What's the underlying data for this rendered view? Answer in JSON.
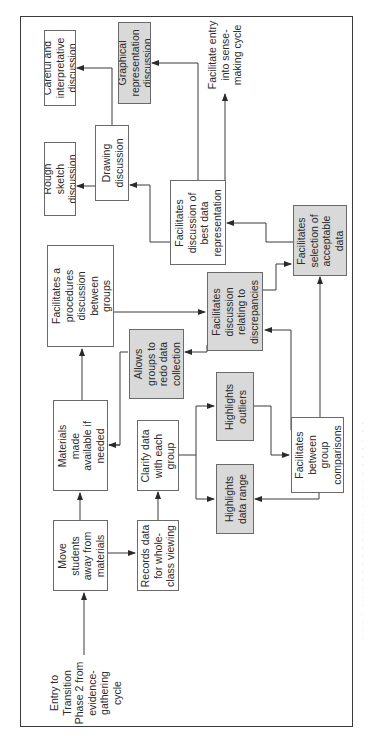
{
  "diagram": {
    "orientation": "rotated 90 degrees counter-clockwise",
    "entry_label": "Entry to\nTransition\nPhase 2 from\nevidence-\ngathering\ncycle",
    "exit_label": "Facilitate entry\ninto sense-\nmaking cycle",
    "nodes": {
      "move_students": {
        "label": "Move\nstudents\naway from\nmaterials",
        "fill": "white"
      },
      "materials_available": {
        "label": "Materials\nmade\navailable if\nneeded",
        "fill": "white"
      },
      "procedures_discussion": {
        "label": "Facilitates a\nprocedures\ndiscussion\nbetween\ngroups",
        "fill": "white"
      },
      "records_data": {
        "label": "Records data\nfor whole-\nclass viewing",
        "fill": "white"
      },
      "clarify_data": {
        "label": "Clarify data\nwith each\ngroup",
        "fill": "white"
      },
      "redo_collection": {
        "label": "Allows\ngroups to\nredo data\ncollection",
        "fill": "gray"
      },
      "highlights_range": {
        "label": "Highlights\ndata range",
        "fill": "gray"
      },
      "highlights_outliers": {
        "label": "Highlights\noutliers",
        "fill": "gray"
      },
      "discrepancies": {
        "label": "Facilitates\ndiscussion\nrelating to\ndiscrepancies",
        "fill": "gray"
      },
      "group_comparisons": {
        "label": "Facilitates\nbetween\ngroup\ncomparisons",
        "fill": "white"
      },
      "acceptable_data": {
        "label": "Facilitates\nselection of\nacceptable\ndata",
        "fill": "gray"
      },
      "best_representation": {
        "label": "Facilitates\ndiscussion of\nbest data\nrepresentation",
        "fill": "white"
      },
      "drawing_discussion": {
        "label": "Drawing\ndiscussion",
        "fill": "white"
      },
      "graphical_discussion": {
        "label": "Graphical\nrepresentation\ndiscussion",
        "fill": "gray"
      },
      "rough_sketch": {
        "label": "Rough\nsketch\ndiscussion",
        "fill": "white"
      },
      "careful_discussion": {
        "label": "Careful and\ninterpretative\ndiscussion",
        "fill": "white"
      }
    },
    "edges": [
      [
        "entry",
        "move_students"
      ],
      [
        "move_students",
        "materials_available"
      ],
      [
        "move_students",
        "records_data"
      ],
      [
        "materials_available",
        "procedures_discussion"
      ],
      [
        "records_data",
        "clarify_data"
      ],
      [
        "clarify_data",
        "highlights_range"
      ],
      [
        "clarify_data",
        "highlights_outliers"
      ],
      [
        "highlights_outliers",
        "group_comparisons"
      ],
      [
        "group_comparisons",
        "highlights_range"
      ],
      [
        "group_comparisons",
        "discrepancies"
      ],
      [
        "group_comparisons",
        "acceptable_data"
      ],
      [
        "procedures_discussion",
        "discrepancies"
      ],
      [
        "discrepancies",
        "redo_collection"
      ],
      [
        "redo_collection",
        "materials_available"
      ],
      [
        "discrepancies",
        "acceptable_data"
      ],
      [
        "acceptable_data",
        "best_representation"
      ],
      [
        "best_representation",
        "drawing_discussion"
      ],
      [
        "best_representation",
        "graphical_discussion"
      ],
      [
        "best_representation",
        "exit"
      ],
      [
        "drawing_discussion",
        "rough_sketch"
      ],
      [
        "drawing_discussion",
        "careful_discussion"
      ]
    ],
    "colors": {
      "gray_fill": "#d9d9d9",
      "white_fill": "#ffffff",
      "line": "#3a3a3a"
    }
  }
}
